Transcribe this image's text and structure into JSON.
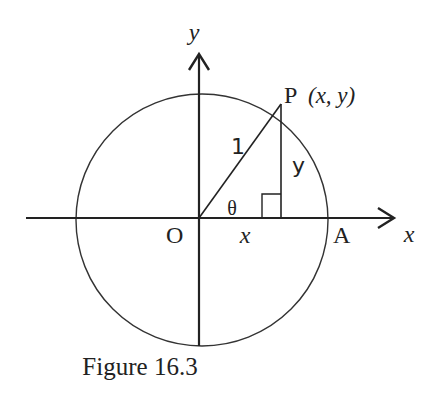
{
  "figure": {
    "caption": "Figure 16.3",
    "axes": {
      "x_label": "x",
      "y_label": "y"
    },
    "points": {
      "origin": "O",
      "point_p": "P",
      "point_p_coords": "(x, y)",
      "point_a": "A"
    },
    "segments": {
      "radius_label": "1",
      "vertical_label": "y",
      "horizontal_label": "x"
    },
    "angle_label": "θ",
    "colors": {
      "stroke": "#222222",
      "background": "#ffffff"
    }
  }
}
